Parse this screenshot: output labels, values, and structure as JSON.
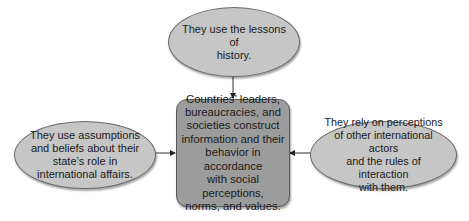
{
  "diagram": {
    "center": {
      "text": "Countries’ leaders,\nbureaucracies, and\nsocieties construct\ninformation and their\nbehavior in accordance\nwith social perceptions,\nnorms, and values."
    },
    "top": {
      "text": "They use the lessons of\nhistory."
    },
    "left": {
      "text": "They use assumptions\nand beliefs about their\nstate’s role in\ninternational affairs."
    },
    "right": {
      "text": "They rely on perceptions\nof other international actors\nand the rules of interaction\nwith them."
    },
    "edges": [
      {
        "from": "top",
        "to": "center"
      },
      {
        "from": "left",
        "to": "center"
      },
      {
        "from": "right",
        "to": "center"
      }
    ],
    "colors": {
      "ellipse_fill": "#c6c6c6",
      "box_fill": "#9c9c9c",
      "stroke": "#5a5a5a"
    }
  }
}
